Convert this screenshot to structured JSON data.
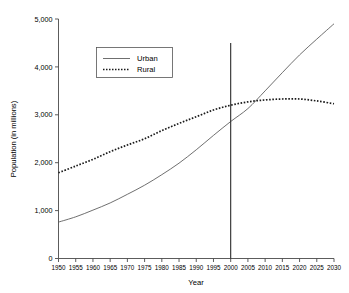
{
  "chart_data": {
    "type": "line",
    "title": "",
    "xlabel": "Year",
    "ylabel": "Population (in millions)",
    "xlim": [
      1950,
      2030
    ],
    "ylim": [
      0,
      5000
    ],
    "grid": false,
    "legend_position": "upper-left-inside",
    "x": [
      1950,
      1955,
      1960,
      1965,
      1970,
      1975,
      1980,
      1985,
      1990,
      1995,
      2000,
      2005,
      2010,
      2015,
      2020,
      2025,
      2030
    ],
    "xtick_labels": [
      "1950",
      "1955",
      "1960",
      "1965",
      "1970",
      "1975",
      "1980",
      "1985",
      "1990",
      "1995",
      "2000",
      "2005",
      "2010",
      "2015",
      "2020",
      "2025",
      "2030"
    ],
    "ytick_values": [
      0,
      1000,
      2000,
      3000,
      4000,
      5000
    ],
    "ytick_labels": [
      "0",
      "1,000",
      "2,000",
      "3,000",
      "4,000",
      "5,000"
    ],
    "series": [
      {
        "name": "Urban",
        "style": "solid",
        "color": "#555555",
        "values": [
          760,
          870,
          1010,
          1160,
          1340,
          1530,
          1750,
          1990,
          2270,
          2570,
          2860,
          3130,
          3500,
          3880,
          4250,
          4580,
          4900
        ]
      },
      {
        "name": "Rural",
        "style": "dotted",
        "color": "#1a1a1a",
        "values": [
          1790,
          1930,
          2070,
          2230,
          2370,
          2500,
          2670,
          2820,
          2960,
          3100,
          3200,
          3270,
          3310,
          3330,
          3330,
          3290,
          3230
        ]
      }
    ],
    "annotations": [
      {
        "name": "year-2000-marker",
        "type": "vertical-line",
        "x": 2000,
        "y_top": 4500,
        "y_bottom": 0,
        "color": "#2a2a2a"
      }
    ]
  },
  "legend": {
    "entries": [
      {
        "label": "Urban"
      },
      {
        "label": "Rural"
      }
    ]
  }
}
